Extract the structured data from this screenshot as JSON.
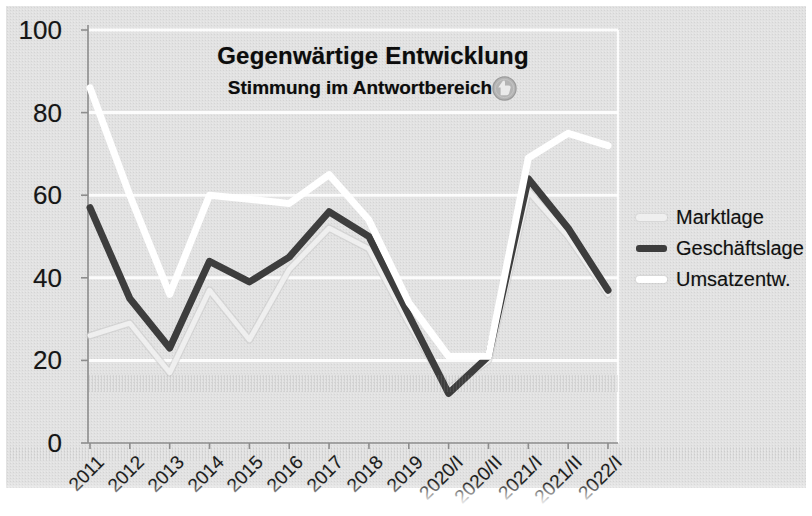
{
  "title": "Gegenwärtige Entwicklung",
  "subtitle": "Stimmung im Antwortbereich",
  "title_icon": "thumb-stamp-icon",
  "colors": {
    "paper": "#e2e2e2",
    "gridline": "#ffffff",
    "axis": "#8d8d8d",
    "marktlage_line": "#efefef",
    "geschaeftslage_line": "#3d3d3d",
    "umsatzentw_line": "#ffffff"
  },
  "chart_data": {
    "type": "line",
    "title": "Gegenwärtige Entwicklung",
    "subtitle": "Stimmung im Antwortbereich",
    "categories": [
      "2011",
      "2012",
      "2013",
      "2014",
      "2015",
      "2016",
      "2017",
      "2018",
      "2019",
      "2020/I",
      "2020/II",
      "2021/I",
      "2021/II",
      "2022/I"
    ],
    "series": [
      {
        "name": "Marktlage",
        "color": "#efefef",
        "halo": "#c9c9c9",
        "width": 5,
        "values": [
          26,
          29,
          17,
          37,
          25,
          42,
          52,
          47,
          29,
          13,
          20,
          61,
          50,
          36
        ]
      },
      {
        "name": "Geschäftslage",
        "color": "#3d3d3d",
        "halo": null,
        "width": 7,
        "values": [
          57,
          35,
          23,
          44,
          39,
          45,
          56,
          50,
          31,
          12,
          21,
          64,
          52,
          37
        ]
      },
      {
        "name": "Umsatzentw.",
        "color": "#ffffff",
        "halo": null,
        "width": 7,
        "values": [
          86,
          60,
          36,
          60,
          59,
          58,
          65,
          54,
          34,
          21,
          21,
          69,
          75,
          72
        ]
      }
    ],
    "ylim": [
      0,
      100
    ],
    "yticks": [
      0,
      20,
      40,
      60,
      80,
      100
    ],
    "xlabel": "",
    "ylabel": "",
    "grid": "horizontal-white",
    "legend_position": "right"
  }
}
